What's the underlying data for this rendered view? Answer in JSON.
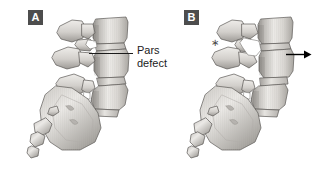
{
  "figure": {
    "background_color": "#ffffff",
    "panel_count": 2
  },
  "panels": [
    {
      "id": "A",
      "badge_label": "A",
      "badge_bg_color": "#4d4d4d",
      "badge_text_color": "#ffffff",
      "description": "normal alignment with pars interarticularis defect"
    },
    {
      "id": "B",
      "badge_label": "B",
      "badge_bg_color": "#4d4d4d",
      "badge_text_color": "#ffffff",
      "description": "anterior slippage of vertebra (spondylolisthesis)"
    }
  ],
  "annotations": {
    "pars_defect": {
      "line_1": "Pars",
      "line_2": "defect",
      "text_color": "#1b1b1b",
      "leader_line_color": "#1b1b1b"
    },
    "slip_arrow": {
      "direction": "right",
      "color": "#000000",
      "icon": "arrow-right-icon"
    },
    "asterisk_marker": {
      "symbol": "∗",
      "color": "#4a4a4a"
    }
  },
  "palette": {
    "bone_light": "#f2f1ef",
    "bone_mid": "#cfcdc9",
    "bone_shadow": "#9b9894",
    "bone_dark": "#6f6c68",
    "outline": "#5a5754",
    "disc": "#e3e1dd",
    "defect_gap": "#ffffff"
  }
}
